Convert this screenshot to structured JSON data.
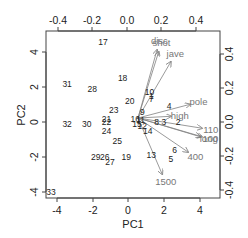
{
  "chart_data": {
    "type": "scatter",
    "subtype": "biplot",
    "title": "",
    "xlabel": "PC1",
    "ylabel": "PC2",
    "xlim": [
      -4.6,
      5.0
    ],
    "ylim": [
      -4.4,
      5.1
    ],
    "x_ticks": [
      "-4",
      "-2",
      "0",
      "2",
      "4"
    ],
    "y_ticks": [
      "-4",
      "-2",
      "0",
      "2",
      "4"
    ],
    "top_axis_ticks": [
      "-0.4",
      "-0.2",
      "0.0",
      "0.2",
      "0.4"
    ],
    "right_axis_ticks": [
      "-0.4",
      "-0.2",
      "0.0",
      "0.2",
      "0.4"
    ],
    "grid": false,
    "legend": null,
    "points": [
      {
        "label": "17",
        "x": -1.4,
        "y": 4.6
      },
      {
        "label": "31",
        "x": -3.4,
        "y": 2.2
      },
      {
        "label": "28",
        "x": -2.0,
        "y": 1.9
      },
      {
        "label": "18",
        "x": -0.3,
        "y": 2.5
      },
      {
        "label": "20",
        "x": 0.1,
        "y": 1.2
      },
      {
        "label": "10",
        "x": 1.2,
        "y": 1.7
      },
      {
        "label": "1",
        "x": 1.3,
        "y": 1.5
      },
      {
        "label": "7",
        "x": 1.3,
        "y": 1.3
      },
      {
        "label": "4",
        "x": 2.3,
        "y": 0.9
      },
      {
        "label": "23",
        "x": -0.8,
        "y": 0.7
      },
      {
        "label": "9",
        "x": 0.8,
        "y": 0.6
      },
      {
        "label": "21",
        "x": -1.2,
        "y": 0.2
      },
      {
        "label": "22",
        "x": -1.2,
        "y": 0.0
      },
      {
        "label": "32",
        "x": -3.4,
        "y": -0.1
      },
      {
        "label": "30",
        "x": -2.3,
        "y": -0.1
      },
      {
        "label": "24",
        "x": -1.2,
        "y": -0.5
      },
      {
        "label": "16",
        "x": 0.4,
        "y": 0.2
      },
      {
        "label": "15",
        "x": 0.5,
        "y": -0.1
      },
      {
        "label": "11",
        "x": 0.7,
        "y": 0.1
      },
      {
        "label": "12",
        "x": 0.8,
        "y": -0.2
      },
      {
        "label": "8",
        "x": 1.6,
        "y": 0.0
      },
      {
        "label": "3",
        "x": 2.0,
        "y": 0.0
      },
      {
        "label": "2",
        "x": 2.8,
        "y": 0.0
      },
      {
        "label": "14",
        "x": 1.1,
        "y": -0.5
      },
      {
        "label": "25",
        "x": -0.6,
        "y": -1.1
      },
      {
        "label": "6",
        "x": 2.6,
        "y": -1.6
      },
      {
        "label": "5",
        "x": 2.4,
        "y": -2.1
      },
      {
        "label": "13",
        "x": 1.3,
        "y": -1.9
      },
      {
        "label": "19",
        "x": -0.1,
        "y": -2.0
      },
      {
        "label": "29",
        "x": -1.8,
        "y": -2.0
      },
      {
        "label": "26",
        "x": -1.3,
        "y": -2.0
      },
      {
        "label": "27",
        "x": -1.0,
        "y": -2.3
      },
      {
        "label": "33",
        "x": -4.3,
        "y": -4.0
      }
    ],
    "loadings": [
      {
        "label": "disc",
        "x": 0.11,
        "y": 0.4
      },
      {
        "label": "shot",
        "x": 0.12,
        "y": 0.39
      },
      {
        "label": "jave",
        "x": 0.19,
        "y": 0.33
      },
      {
        "label": "pole",
        "x": 0.3,
        "y": 0.08
      },
      {
        "label": "high",
        "x": 0.19,
        "y": 0.01
      },
      {
        "label": "110",
        "x": 0.37,
        "y": -0.06
      },
      {
        "label": "long",
        "x": 0.36,
        "y": -0.11
      },
      {
        "label": "100",
        "x": 0.37,
        "y": -0.11
      },
      {
        "label": "400",
        "x": 0.29,
        "y": -0.2
      },
      {
        "label": "1500",
        "x": 0.14,
        "y": -0.33
      }
    ]
  },
  "axes": {
    "xlabel": "PC1",
    "ylabel": "PC2",
    "bottom_ticks": [
      "-4",
      "-2",
      "0",
      "2",
      "4"
    ],
    "left_ticks": [
      "-4",
      "-2",
      "0",
      "2",
      "4"
    ],
    "top_ticks": [
      "-0.4",
      "-0.2",
      "0.0",
      "0.2",
      "0.4"
    ],
    "right_ticks": [
      "-0.4",
      "-0.2",
      "0.0",
      "0.2",
      "0.4"
    ]
  },
  "colors": {
    "points": "#222222",
    "arrows": "#808080",
    "frame": "#444444"
  }
}
